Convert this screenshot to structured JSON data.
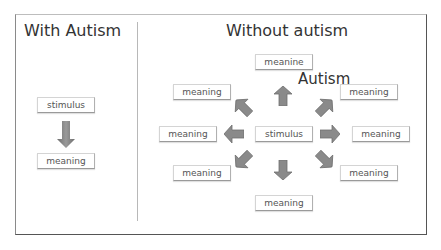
{
  "diagram": {
    "left_panel": {
      "title": "With Autism",
      "stimulus": "stimulus",
      "meaning": "meaning"
    },
    "right_panel": {
      "title": "Without autism",
      "overlay_text": "Autism",
      "stimulus": "stimulus",
      "meanings": {
        "top": "meanine",
        "upper_left": "meaning",
        "upper_right": "meaning",
        "left": "meaning",
        "right": "meaning",
        "lower_left": "meaning",
        "lower_right": "meaning",
        "bottom": "meaning"
      }
    },
    "colors": {
      "arrow_fill": "#8c8c8c",
      "arrow_dark": "#6e6e6e",
      "arrow_accent": "#c56a4a",
      "frame": "#555555",
      "box_border": "#d4d4d4"
    }
  }
}
